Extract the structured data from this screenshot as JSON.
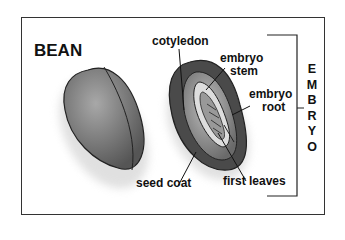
{
  "diagram": {
    "title": "BEAN",
    "labels": {
      "cotyledon": "cotyledon",
      "embryo_stem_1": "embryo",
      "embryo_stem_2": "stem",
      "embryo_root_1": "embryo",
      "embryo_root_2": "root",
      "seed_coat": "seed coat",
      "first_leaves": "first leaves"
    },
    "bracket_label": [
      "E",
      "M",
      "B",
      "R",
      "Y",
      "O"
    ],
    "colors": {
      "outline": "#222222",
      "seed_dark": "#555555",
      "seed_mid": "#8a8a8a",
      "seed_light": "#c8c8c8"
    }
  }
}
